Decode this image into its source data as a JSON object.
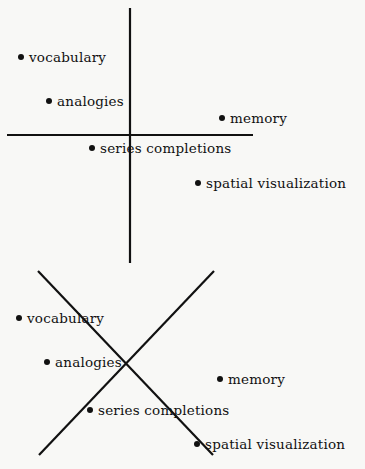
{
  "diagrams": [
    {
      "name": "orthogonal-axes",
      "axes": {
        "vertical": {
          "x1": 130,
          "y1": 8,
          "x2": 130,
          "y2": 263
        },
        "horizontal": {
          "x1": 7,
          "y1": 135,
          "x2": 253,
          "y2": 135
        }
      },
      "points": [
        {
          "label": "vocabulary",
          "x": 21,
          "y": 57
        },
        {
          "label": "analogies",
          "x": 49,
          "y": 101
        },
        {
          "label": "memory",
          "x": 222,
          "y": 118
        },
        {
          "label": "series completions",
          "x": 92,
          "y": 148
        },
        {
          "label": "spatial visualization",
          "x": 198,
          "y": 183
        }
      ]
    },
    {
      "name": "rotated-axes",
      "axes": {
        "diagonal_down": {
          "x1": 38,
          "y1": 271,
          "x2": 213,
          "y2": 455
        },
        "diagonal_up": {
          "x1": 214,
          "y1": 271,
          "x2": 39,
          "y2": 455
        }
      },
      "points": [
        {
          "label": "vocabulary",
          "x": 19,
          "y": 318
        },
        {
          "label": "analogies",
          "x": 47,
          "y": 362
        },
        {
          "label": "memory",
          "x": 220,
          "y": 379
        },
        {
          "label": "series completions",
          "x": 90,
          "y": 410
        },
        {
          "label": "spatial visualization",
          "x": 197,
          "y": 444
        }
      ]
    }
  ],
  "colors": {
    "background": "#f8f8f6",
    "ink": "#111111"
  }
}
